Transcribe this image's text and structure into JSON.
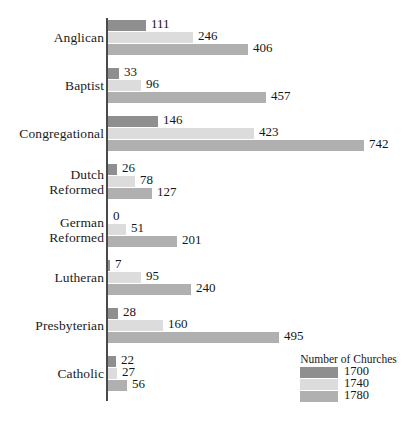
{
  "chart_data": {
    "type": "bar",
    "orientation": "horizontal",
    "title": "",
    "xlabel": "",
    "ylabel": "",
    "grid": false,
    "xlim": [
      0,
      742
    ],
    "categories": [
      "Anglican",
      "Baptist",
      "Congregational",
      "Dutch Reformed",
      "German Reformed",
      "Lutheran",
      "Presbyterian",
      "Catholic"
    ],
    "series": [
      {
        "name": "1700",
        "color": "#8f8f8f",
        "values": [
          111,
          33,
          146,
          26,
          0,
          7,
          28,
          22
        ]
      },
      {
        "name": "1740",
        "color": "#dcdcdc",
        "values": [
          246,
          96,
          423,
          78,
          51,
          95,
          160,
          27
        ]
      },
      {
        "name": "1780",
        "color": "#b0b0b0",
        "values": [
          406,
          457,
          742,
          127,
          201,
          240,
          495,
          56
        ]
      }
    ],
    "legend": {
      "title": "Number of Churches",
      "position": "bottom-right",
      "entries": [
        "1700",
        "1740",
        "1780"
      ]
    }
  },
  "colors": {
    "background": "#ffffff",
    "axis": "#4a4a4a",
    "text": "#161616",
    "series_1700": "#8f8f8f",
    "series_1740": "#dcdcdc",
    "series_1780": "#b0b0b0"
  },
  "categories_display": [
    {
      "lines": [
        "Anglican"
      ]
    },
    {
      "lines": [
        "Baptist"
      ]
    },
    {
      "lines": [
        "Congregational"
      ]
    },
    {
      "lines": [
        "Dutch",
        "Reformed"
      ]
    },
    {
      "lines": [
        "German",
        "Reformed"
      ]
    },
    {
      "lines": [
        "Lutheran"
      ]
    },
    {
      "lines": [
        "Presbyterian"
      ]
    },
    {
      "lines": [
        "Catholic"
      ]
    }
  ]
}
